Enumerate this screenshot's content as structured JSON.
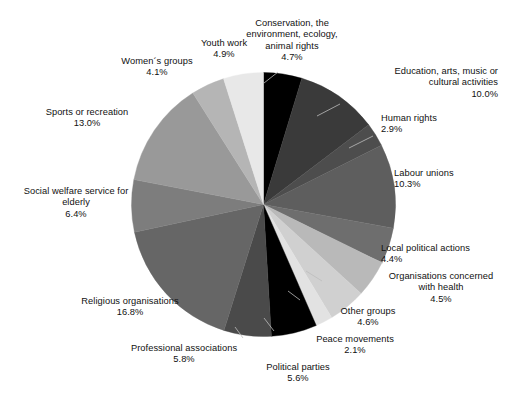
{
  "chart_data": {
    "type": "pie",
    "title": "",
    "subtitle": "",
    "xlabel": "",
    "ylabel": "",
    "legend_position": "none",
    "grid": false,
    "label_format": "name + percent",
    "start_angle_deg": 0,
    "direction": "clockwise",
    "categories": [
      "Conservation, the environment, ecology, animal rights",
      "Education, arts, music or cultural activities",
      "Human rights",
      "Labour unions",
      "Local political actions",
      "Organisations concerned with health",
      "Other groups",
      "Peace movements",
      "Political parties",
      "Professional associations",
      "Religious organisations",
      "Social welfare service for elderly",
      "Sports or recreation",
      "Women´s groups",
      "Youth work"
    ],
    "values": [
      4.7,
      10.0,
      2.9,
      10.3,
      4.4,
      4.5,
      4.6,
      2.1,
      5.6,
      5.8,
      16.8,
      6.4,
      13.0,
      4.1,
      4.9
    ],
    "colors": [
      "#000000",
      "#3a3a3a",
      "#4d4d4d",
      "#5e5e5e",
      "#6e6e6e",
      "#b9b9b9",
      "#d0d0d0",
      "#e2e2e2",
      "#000000",
      "#4a4a4a",
      "#666666",
      "#7d7d7d",
      "#999999",
      "#b5b5b5",
      "#e8e8e8"
    ],
    "slices": [
      {
        "label": "Conservation, the\nenvironment, ecology,\nanimal rights",
        "percent": "4.7%",
        "value": 4.7,
        "color": "#000000"
      },
      {
        "label": "Education, arts, music or\ncultural activities",
        "percent": "10.0%",
        "value": 10.0,
        "color": "#3a3a3a"
      },
      {
        "label": "Human rights",
        "percent": "2.9%",
        "value": 2.9,
        "color": "#4d4d4d"
      },
      {
        "label": "Labour unions",
        "percent": "10.3%",
        "value": 10.3,
        "color": "#5e5e5e"
      },
      {
        "label": "Local political actions",
        "percent": "4.4%",
        "value": 4.4,
        "color": "#6e6e6e"
      },
      {
        "label": "Organisations concerned\nwith health",
        "percent": "4.5%",
        "value": 4.5,
        "color": "#b9b9b9"
      },
      {
        "label": "Other groups",
        "percent": "4.6%",
        "value": 4.6,
        "color": "#d0d0d0"
      },
      {
        "label": "Peace movements",
        "percent": "2.1%",
        "value": 2.1,
        "color": "#e2e2e2"
      },
      {
        "label": "Political parties",
        "percent": "5.6%",
        "value": 5.6,
        "color": "#000000"
      },
      {
        "label": "Professional associations",
        "percent": "5.8%",
        "value": 5.8,
        "color": "#4a4a4a"
      },
      {
        "label": "Religious organisations",
        "percent": "16.8%",
        "value": 16.8,
        "color": "#666666"
      },
      {
        "label": "Social welfare service for\nelderly",
        "percent": "6.4%",
        "value": 6.4,
        "color": "#7d7d7d"
      },
      {
        "label": "Sports or recreation",
        "percent": "13.0%",
        "value": 13.0,
        "color": "#999999"
      },
      {
        "label": "Women´s groups",
        "percent": "4.1%",
        "value": 4.1,
        "color": "#b5b5b5"
      },
      {
        "label": "Youth work",
        "percent": "4.9%",
        "value": 4.9,
        "color": "#e8e8e8"
      }
    ]
  },
  "labels": {
    "conservation": {
      "line1": "Conservation, the",
      "line2": "environment, ecology,",
      "line3": "animal rights",
      "pct": "4.7%"
    },
    "education": {
      "line1": "Education, arts, music or",
      "line2": "cultural activities",
      "pct": "10.0%"
    },
    "human_rights": {
      "line1": "Human rights",
      "pct": "2.9%"
    },
    "labour": {
      "line1": "Labour unions",
      "pct": "10.3%"
    },
    "local_pol": {
      "line1": "Local political actions",
      "pct": "4.4%"
    },
    "health": {
      "line1": "Organisations concerned",
      "line2": "with health",
      "pct": "4.5%"
    },
    "other": {
      "line1": "Other groups",
      "pct": "4.6%"
    },
    "peace": {
      "line1": "Peace movements",
      "pct": "2.1%"
    },
    "political": {
      "line1": "Political parties",
      "pct": "5.6%"
    },
    "professional": {
      "line1": "Professional associations",
      "pct": "5.8%"
    },
    "religious": {
      "line1": "Religious organisations",
      "pct": "16.8%"
    },
    "welfare": {
      "line1": "Social welfare service for",
      "line2": "elderly",
      "pct": "6.4%"
    },
    "sports": {
      "line1": "Sports or recreation",
      "pct": "13.0%"
    },
    "women": {
      "line1": "Women´s groups",
      "pct": "4.1%"
    },
    "youth": {
      "line1": "Youth work",
      "pct": "4.9%"
    }
  }
}
